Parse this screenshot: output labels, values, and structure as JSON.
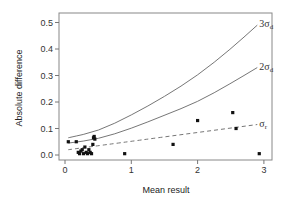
{
  "chart_data": {
    "type": "scatter",
    "title": "",
    "xlabel": "Mean result",
    "ylabel": "Absolute difference",
    "xlim": [
      -0.1,
      3.1
    ],
    "ylim": [
      -0.02,
      0.53
    ],
    "xticks": [
      0,
      1,
      2,
      3
    ],
    "xtick_labels": [
      "0",
      "1",
      "2",
      "3"
    ],
    "yticks": [
      0.0,
      0.1,
      0.2,
      0.3,
      0.4,
      0.5
    ],
    "ytick_labels": [
      "0.0",
      "0.1",
      "0.2",
      "0.3",
      "0.4",
      "0.5"
    ],
    "grid": false,
    "legend": "inline curve labels at right end",
    "series": [
      {
        "name": "observations",
        "kind": "points",
        "points": [
          [
            0.05,
            0.05
          ],
          [
            0.17,
            0.05
          ],
          [
            0.2,
            0.01
          ],
          [
            0.22,
            0.005
          ],
          [
            0.24,
            0.015
          ],
          [
            0.26,
            0.02
          ],
          [
            0.28,
            0.005
          ],
          [
            0.3,
            0.03
          ],
          [
            0.32,
            0.01
          ],
          [
            0.34,
            0.005
          ],
          [
            0.36,
            0.02
          ],
          [
            0.38,
            0.01
          ],
          [
            0.4,
            0.005
          ],
          [
            0.42,
            0.04
          ],
          [
            0.43,
            0.065
          ],
          [
            0.44,
            0.07
          ],
          [
            0.45,
            0.06
          ],
          [
            0.9,
            0.005
          ],
          [
            1.63,
            0.04
          ],
          [
            2.0,
            0.13
          ],
          [
            2.53,
            0.16
          ],
          [
            2.58,
            0.1
          ],
          [
            2.93,
            0.005
          ]
        ]
      },
      {
        "name": "3σd",
        "label_main": "3σ",
        "label_sub": "d",
        "kind": "solid",
        "x": [
          0.05,
          0.5,
          1.0,
          1.5,
          2.0,
          2.5,
          2.9
        ],
        "y": [
          0.065,
          0.09,
          0.15,
          0.22,
          0.3,
          0.4,
          0.49
        ]
      },
      {
        "name": "2σd",
        "label_main": "2σ",
        "label_sub": "d",
        "kind": "solid",
        "x": [
          0.05,
          0.5,
          1.0,
          1.5,
          2.0,
          2.5,
          2.9
        ],
        "y": [
          0.045,
          0.06,
          0.1,
          0.15,
          0.2,
          0.27,
          0.33
        ]
      },
      {
        "name": "σr",
        "label_main": "σ",
        "label_sub": "r",
        "kind": "dashed",
        "x": [
          0.05,
          2.9
        ],
        "y": [
          0.02,
          0.115
        ]
      }
    ]
  }
}
